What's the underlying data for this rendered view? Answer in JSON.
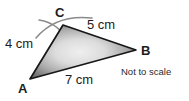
{
  "figure": {
    "type": "triangle-construction-diagram",
    "background_color": "#ffffff",
    "outline_color": "#1a1a1a",
    "fill_center_color": "#ececec",
    "fill_edge_color": "#6e6e6e",
    "arc_color": "#7a7a7a",
    "vertices": [
      {
        "name": "A",
        "label": "A",
        "x": 30,
        "y": 79
      },
      {
        "name": "B",
        "label": "B",
        "x": 136,
        "y": 50
      },
      {
        "name": "C",
        "label": "C",
        "x": 63,
        "y": 25
      }
    ],
    "sides": [
      {
        "name": "side-ac",
        "from": "A",
        "to": "C",
        "label": "4 cm",
        "length": 4,
        "unit": "cm"
      },
      {
        "name": "side-cb",
        "from": "C",
        "to": "B",
        "label": "5 cm",
        "length": 5,
        "unit": "cm"
      },
      {
        "name": "side-ab",
        "from": "A",
        "to": "B",
        "label": "7 cm",
        "length": 7,
        "unit": "cm"
      }
    ],
    "construction_arcs": [
      {
        "name": "arc-from-a",
        "description": "compass arc radius 4 cm centered at A crossing near C"
      },
      {
        "name": "arc-from-b",
        "description": "compass arc radius 5 cm centered at B crossing near C"
      }
    ],
    "note": "Not to scale"
  }
}
